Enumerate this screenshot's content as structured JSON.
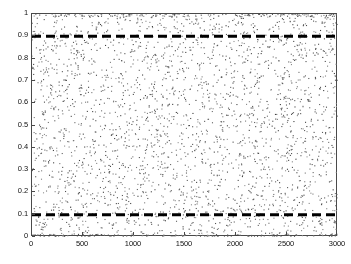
{
  "chart_data": {
    "type": "scatter",
    "title": "",
    "subtitle": "",
    "xlabel": "",
    "ylabel": "",
    "xlim": [
      0,
      3000
    ],
    "ylim": [
      0,
      1
    ],
    "grid": false,
    "legend": null,
    "x_ticks": [
      0,
      500,
      1000,
      1500,
      2000,
      2500,
      3000
    ],
    "x_tick_labels": [
      "0",
      "500",
      "1000",
      "1500",
      "2000",
      "2500",
      "3000"
    ],
    "y_ticks": [
      0,
      0.1,
      0.2,
      0.3,
      0.4,
      0.5,
      0.6,
      0.7,
      0.8,
      0.9,
      1
    ],
    "y_tick_labels": [
      "0",
      "0.1",
      "0.2",
      "0.3",
      "0.4",
      "0.5",
      "0.6",
      "0.7",
      "0.8",
      "0.9",
      "1"
    ],
    "series": [
      {
        "name": "samples",
        "marker": "dot",
        "marker_size": 1.1,
        "color": "#555555",
        "n_points": 3000,
        "distribution": "uniform",
        "x_range": [
          0,
          3000
        ],
        "y_range": [
          0,
          1
        ],
        "edge_pileup": {
          "top_value": 1.0,
          "bottom_value": 0.0,
          "top_fraction": 0.055,
          "bottom_fraction": 0.04
        }
      }
    ],
    "reference_lines": [
      {
        "name": "upper-bound",
        "orientation": "horizontal",
        "value": 0.9,
        "style": "dashed",
        "color": "#000000",
        "width": 3,
        "dash": [
          9,
          5
        ]
      },
      {
        "name": "lower-bound",
        "orientation": "horizontal",
        "value": 0.1,
        "style": "dashed",
        "color": "#000000",
        "width": 3,
        "dash": [
          9,
          5
        ]
      }
    ],
    "axis_color": "#4a4a4a",
    "background_color": "#ffffff"
  }
}
